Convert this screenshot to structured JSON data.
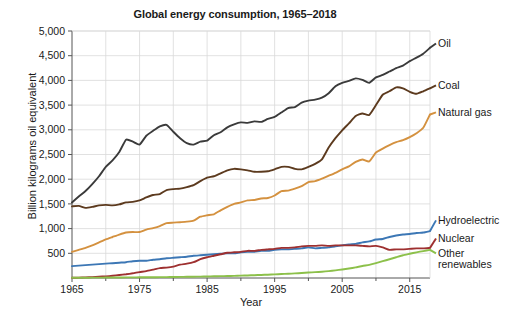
{
  "chart_data": {
    "type": "line",
    "title": "Global energy consumption, 1965–2018",
    "xlabel": "Year",
    "ylabel": "Billion kilograms oil equivalent",
    "xlim": [
      1965,
      2018
    ],
    "ylim": [
      0,
      5000
    ],
    "ytick_labels": [
      "500",
      "1,000",
      "1,500",
      "2,000",
      "2,500",
      "3,000",
      "3,500",
      "4,000",
      "4,500",
      "5,000"
    ],
    "ytick_values": [
      500,
      1000,
      1500,
      2000,
      2500,
      3000,
      3500,
      4000,
      4500,
      5000
    ],
    "xtick_labels": [
      "1965",
      "1975",
      "1985",
      "1995",
      "2005",
      "2015"
    ],
    "xtick_values": [
      1965,
      1975,
      1985,
      1995,
      2005,
      2015
    ],
    "xminor_ticks": [
      1970,
      1980,
      1990,
      2000,
      2010
    ],
    "grid": true,
    "legend_position": "right-inline-labels",
    "x": [
      1965,
      1966,
      1967,
      1968,
      1969,
      1970,
      1971,
      1972,
      1973,
      1974,
      1975,
      1976,
      1977,
      1978,
      1979,
      1980,
      1981,
      1982,
      1983,
      1984,
      1985,
      1986,
      1987,
      1988,
      1989,
      1990,
      1991,
      1992,
      1993,
      1994,
      1995,
      1996,
      1997,
      1998,
      1999,
      2000,
      2001,
      2002,
      2003,
      2004,
      2005,
      2006,
      2007,
      2008,
      2009,
      2010,
      2011,
      2012,
      2013,
      2014,
      2015,
      2016,
      2017,
      2018
    ],
    "series": [
      {
        "name": "Oil",
        "color": "#3a3a3a",
        "label_value": 4660,
        "values": [
          1530,
          1650,
          1760,
          1900,
          2060,
          2250,
          2380,
          2550,
          2800,
          2760,
          2700,
          2880,
          2980,
          3070,
          3100,
          2960,
          2830,
          2730,
          2700,
          2760,
          2780,
          2890,
          2950,
          3050,
          3110,
          3150,
          3140,
          3170,
          3160,
          3220,
          3260,
          3350,
          3440,
          3460,
          3550,
          3590,
          3610,
          3650,
          3740,
          3880,
          3950,
          3990,
          4040,
          4010,
          3950,
          4060,
          4110,
          4180,
          4250,
          4300,
          4390,
          4460,
          4540,
          4660
        ]
      },
      {
        "name": "Coal",
        "color": "#5c3a1e",
        "label_value": 3770,
        "values": [
          1450,
          1460,
          1420,
          1440,
          1470,
          1480,
          1470,
          1490,
          1530,
          1540,
          1570,
          1630,
          1680,
          1700,
          1780,
          1800,
          1810,
          1840,
          1880,
          1960,
          2030,
          2060,
          2120,
          2180,
          2210,
          2200,
          2180,
          2150,
          2150,
          2160,
          2200,
          2250,
          2250,
          2210,
          2200,
          2250,
          2310,
          2400,
          2640,
          2830,
          2990,
          3130,
          3280,
          3330,
          3300,
          3500,
          3710,
          3780,
          3860,
          3840,
          3770,
          3730,
          3780,
          3840
        ]
      },
      {
        "name": "Natural gas",
        "color": "#d4913f",
        "label_value": 3310,
        "values": [
          530,
          570,
          610,
          660,
          720,
          780,
          830,
          880,
          920,
          930,
          930,
          980,
          1010,
          1050,
          1110,
          1120,
          1130,
          1140,
          1160,
          1240,
          1270,
          1290,
          1370,
          1440,
          1500,
          1530,
          1570,
          1580,
          1610,
          1620,
          1670,
          1760,
          1770,
          1810,
          1860,
          1940,
          1960,
          2010,
          2070,
          2130,
          2200,
          2260,
          2350,
          2400,
          2360,
          2540,
          2620,
          2690,
          2750,
          2790,
          2850,
          2930,
          3040,
          3310
        ]
      },
      {
        "name": "Hydroelectric",
        "color": "#3c77b5",
        "label_value": 950,
        "values": [
          240,
          250,
          260,
          270,
          280,
          290,
          300,
          310,
          320,
          340,
          350,
          350,
          370,
          380,
          400,
          410,
          420,
          430,
          450,
          460,
          470,
          480,
          490,
          500,
          500,
          520,
          530,
          530,
          550,
          550,
          570,
          580,
          580,
          590,
          600,
          620,
          600,
          610,
          620,
          640,
          660,
          680,
          690,
          720,
          740,
          780,
          790,
          830,
          860,
          880,
          890,
          910,
          920,
          950
        ]
      },
      {
        "name": "Nuclear",
        "color": "#9e3030",
        "label_value": 610,
        "values": [
          5,
          8,
          12,
          18,
          25,
          33,
          45,
          60,
          75,
          95,
          120,
          140,
          170,
          200,
          210,
          230,
          270,
          290,
          320,
          380,
          420,
          450,
          480,
          510,
          520,
          530,
          550,
          550,
          570,
          580,
          590,
          610,
          610,
          620,
          640,
          650,
          650,
          660,
          650,
          660,
          660,
          660,
          660,
          650,
          640,
          650,
          620,
          570,
          580,
          580,
          590,
          600,
          600,
          610
        ]
      },
      {
        "name": "Other renewables",
        "color": "#8cc04a",
        "label_value": 570,
        "values": [
          4,
          5,
          6,
          7,
          8,
          9,
          10,
          11,
          12,
          13,
          14,
          15,
          16,
          17,
          18,
          20,
          22,
          24,
          26,
          28,
          31,
          34,
          37,
          40,
          44,
          48,
          52,
          57,
          62,
          67,
          73,
          80,
          86,
          93,
          101,
          110,
          118,
          128,
          140,
          155,
          172,
          192,
          215,
          243,
          265,
          300,
          340,
          380,
          420,
          460,
          490,
          520,
          545,
          570
        ]
      }
    ]
  },
  "labels": {
    "oil": "Oil",
    "coal": "Coal",
    "natural_gas": "Natural gas",
    "hydroelectric": "Hydroelectric",
    "nuclear": "Nuclear",
    "other_renewables_line1": "Other",
    "other_renewables_line2": "renewables"
  }
}
